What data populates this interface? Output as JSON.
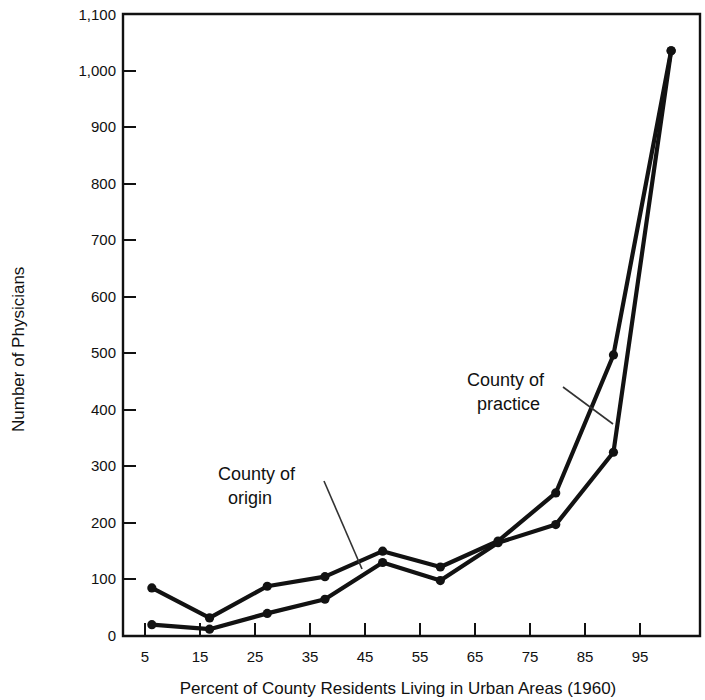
{
  "chart_data": {
    "type": "line",
    "title": "",
    "xlabel": "Percent of County Residents Living in Urban Areas (1960)",
    "ylabel": "Number of Physicians",
    "x": [
      5,
      15,
      25,
      35,
      45,
      55,
      65,
      75,
      85,
      95
    ],
    "xticklabels": [
      "5",
      "15",
      "25",
      "35",
      "45",
      "55",
      "65",
      "75",
      "85",
      "95"
    ],
    "yticks": [
      0,
      100,
      200,
      300,
      400,
      500,
      600,
      700,
      800,
      900,
      1000,
      1100
    ],
    "yticklabels": [
      "0",
      "100",
      "200",
      "300",
      "400",
      "500",
      "600",
      "700",
      "800",
      "900",
      "1,000",
      "1,100"
    ],
    "xlim": [
      0,
      100
    ],
    "ylim": [
      0,
      1100
    ],
    "grid": false,
    "legend_position": "inline-annotations",
    "series": [
      {
        "name": "County of practice",
        "values": [
          85,
          32,
          88,
          105,
          150,
          122,
          168,
          253,
          497,
          1035
        ]
      },
      {
        "name": "County of origin",
        "values": [
          20,
          12,
          40,
          65,
          130,
          98,
          165,
          197,
          325,
          1035
        ]
      }
    ],
    "annotations": [
      {
        "text_line1": "County of",
        "text_line2": "practice",
        "target_series": "County of practice"
      },
      {
        "text_line1": "County of",
        "text_line2": "origin",
        "target_series": "County of origin"
      }
    ],
    "colors": {
      "line": "#121212",
      "axis": "#111111",
      "background": "#ffffff",
      "text": "#111111"
    }
  }
}
